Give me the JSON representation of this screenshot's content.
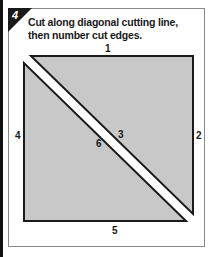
{
  "step": {
    "number": "4",
    "instruction_line1": "Cut along diagonal cutting line,",
    "instruction_line2": "then number cut edges."
  },
  "diagram": {
    "fill_color": "#c8c8c8",
    "edge_color": "#1a1a1a",
    "cut_line_color": "#ffffff",
    "edge_labels": {
      "top": "1",
      "right": "2",
      "cut_upper": "3",
      "left": "4",
      "bottom": "5",
      "cut_lower": "6"
    }
  }
}
